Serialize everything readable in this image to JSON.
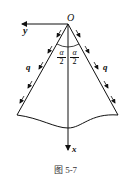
{
  "diagram": {
    "origin_label": "O",
    "y_axis_label": "y",
    "x_axis_label": "x",
    "load_label_left": "q",
    "load_label_right": "q",
    "half_angle_left": {
      "num": "α",
      "den": "2"
    },
    "half_angle_right": {
      "num": "α",
      "den": "2"
    },
    "caption": "图   5-7",
    "colors": {
      "line": "#111111",
      "background": "#ffffff"
    }
  }
}
